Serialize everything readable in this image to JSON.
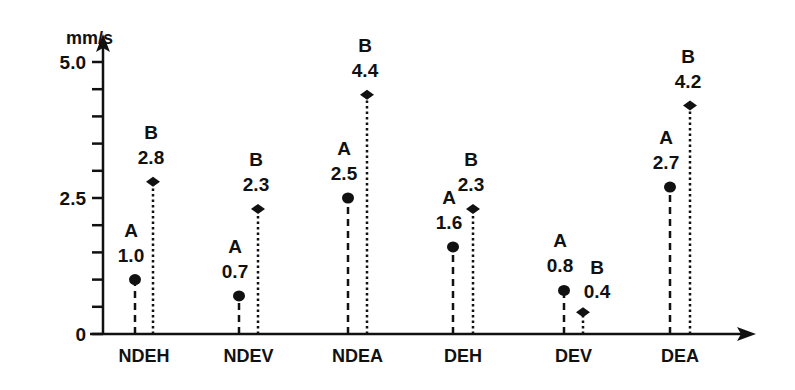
{
  "chart_data": {
    "type": "scatter",
    "subtype": "lollipop",
    "title": "",
    "xlabel": "",
    "ylabel": "mm/s",
    "ylim": [
      0,
      5.0
    ],
    "y_ticks": [
      0,
      0.5,
      1.0,
      1.5,
      2.0,
      2.5,
      3.0,
      3.5,
      4.0,
      4.5,
      5.0
    ],
    "y_tick_labels": [
      {
        "value": 0,
        "label": "0"
      },
      {
        "value": 2.5,
        "label": "2.5"
      },
      {
        "value": 5.0,
        "label": "5.0"
      }
    ],
    "categories": [
      "NDEH",
      "NDEV",
      "NDEA",
      "DEH",
      "DEV",
      "DEA"
    ],
    "series": [
      {
        "name": "A",
        "marker": "circle",
        "line_style": "dashed",
        "values": [
          1.0,
          0.7,
          2.5,
          1.6,
          0.8,
          2.7
        ],
        "value_labels": [
          "1.0",
          "0.7",
          "2.5",
          "1.6",
          "0.8",
          "2.7"
        ]
      },
      {
        "name": "B",
        "marker": "diamond",
        "line_style": "dotted",
        "values": [
          2.8,
          2.3,
          4.4,
          2.3,
          0.4,
          4.2
        ],
        "value_labels": [
          "2.8",
          "2.3",
          "4.4",
          "2.3",
          "0.4",
          "4.2"
        ]
      }
    ],
    "grid": false,
    "legend": "none (series letters annotated above each point)"
  },
  "colors": {
    "ink": "#111111",
    "background": "#ffffff"
  }
}
